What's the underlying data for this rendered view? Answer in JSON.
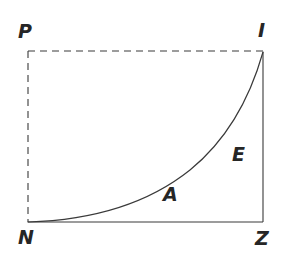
{
  "figure": {
    "canvas": {
      "width": 302,
      "height": 264,
      "background": "#ffffff"
    },
    "style": {
      "stroke_color": "#3a3a3a",
      "solid_stroke_width": 1.1,
      "dashed_stroke_width": 1.1,
      "curve_stroke_width": 1.2,
      "dash_pattern": "7 5",
      "label_color": "#262626"
    },
    "vertices": [
      {
        "id": "P",
        "label": "P",
        "x": 28,
        "y": 51,
        "label_x": 18,
        "label_y": 22
      },
      {
        "id": "I",
        "label": "I",
        "x": 263,
        "y": 52,
        "label_x": 258,
        "label_y": 21
      },
      {
        "id": "Z",
        "label": "Z",
        "x": 263,
        "y": 222,
        "label_x": 255,
        "label_y": 229
      },
      {
        "id": "N",
        "label": "N",
        "x": 28,
        "y": 222,
        "label_x": 18,
        "label_y": 228
      }
    ],
    "edges": [
      {
        "id": "top",
        "from": "P",
        "to": "I",
        "style": "dashed"
      },
      {
        "id": "left",
        "from": "P",
        "to": "N",
        "style": "dashed"
      },
      {
        "id": "right",
        "from": "I",
        "to": "Z",
        "style": "solid"
      },
      {
        "id": "bottom",
        "from": "N",
        "to": "Z",
        "style": "solid"
      }
    ],
    "region_labels": [
      {
        "id": "E",
        "label": "E",
        "x": 232,
        "y": 145
      },
      {
        "id": "A",
        "label": "A",
        "x": 163,
        "y": 185
      }
    ],
    "curve": {
      "id": "exponential-curve",
      "from": "N",
      "to": "I",
      "style": "solid",
      "shape": "convex-increasing",
      "path": "M 28 222 C 95 220, 150 202, 190 170 C 222 144, 248 105, 263 52"
    }
  }
}
